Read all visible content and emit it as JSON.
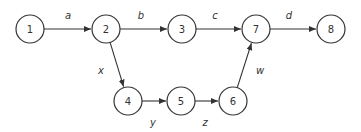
{
  "diagram": {
    "type": "directed-graph",
    "nodes": [
      {
        "id": "1",
        "label": "1",
        "x": 30,
        "y": 29
      },
      {
        "id": "2",
        "label": "2",
        "x": 106,
        "y": 29
      },
      {
        "id": "3",
        "label": "3",
        "x": 182,
        "y": 29
      },
      {
        "id": "7",
        "label": "7",
        "x": 256,
        "y": 29
      },
      {
        "id": "8",
        "label": "8",
        "x": 331,
        "y": 29
      },
      {
        "id": "4",
        "label": "4",
        "x": 128,
        "y": 101
      },
      {
        "id": "5",
        "label": "5",
        "x": 181,
        "y": 101
      },
      {
        "id": "6",
        "label": "6",
        "x": 233,
        "y": 101
      }
    ],
    "edges": [
      {
        "from": "1",
        "to": "2",
        "label": "a",
        "lx": 68,
        "ly": 15
      },
      {
        "from": "2",
        "to": "3",
        "label": "b",
        "lx": 141,
        "ly": 15
      },
      {
        "from": "3",
        "to": "7",
        "label": "c",
        "lx": 215,
        "ly": 15
      },
      {
        "from": "7",
        "to": "8",
        "label": "d",
        "lx": 289,
        "ly": 15
      },
      {
        "from": "2",
        "to": "4",
        "label": "x",
        "lx": 101,
        "ly": 70
      },
      {
        "from": "4",
        "to": "5",
        "label": "y",
        "lx": 153,
        "ly": 122
      },
      {
        "from": "5",
        "to": "6",
        "label": "z",
        "lx": 205,
        "ly": 122
      },
      {
        "from": "6",
        "to": "7",
        "label": "w",
        "lx": 260,
        "ly": 70
      }
    ],
    "node_radius": 14
  }
}
